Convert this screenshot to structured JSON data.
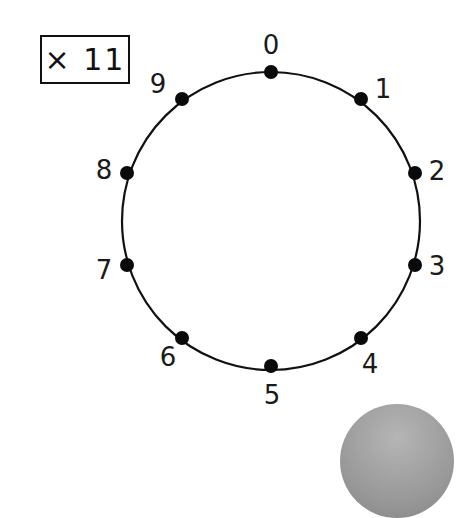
{
  "operation_box": {
    "symbol": "×",
    "value": "11",
    "display": "× 11"
  },
  "circle": {
    "center": [
      271,
      221
    ],
    "radius": 149,
    "points": [
      {
        "label": "0",
        "x": 271,
        "y": 72,
        "lx": 271,
        "ly": 45
      },
      {
        "label": "1",
        "x": 361,
        "y": 99,
        "lx": 383,
        "ly": 89
      },
      {
        "label": "2",
        "x": 415,
        "y": 173,
        "lx": 437,
        "ly": 171
      },
      {
        "label": "3",
        "x": 415,
        "y": 265,
        "lx": 437,
        "ly": 266
      },
      {
        "label": "4",
        "x": 361,
        "y": 338,
        "lx": 370,
        "ly": 364
      },
      {
        "label": "5",
        "x": 271,
        "y": 366,
        "lx": 272,
        "ly": 395
      },
      {
        "label": "6",
        "x": 182,
        "y": 338,
        "lx": 168,
        "ly": 357
      },
      {
        "label": "7",
        "x": 127,
        "y": 265,
        "lx": 104,
        "ly": 270
      },
      {
        "label": "8",
        "x": 127,
        "y": 173,
        "lx": 104,
        "ly": 170
      },
      {
        "label": "9",
        "x": 182,
        "y": 99,
        "lx": 158,
        "ly": 84
      }
    ]
  },
  "colors": {
    "stroke": "#111111",
    "dot": "#0a0a0a",
    "blob": "#9a9a9a"
  }
}
